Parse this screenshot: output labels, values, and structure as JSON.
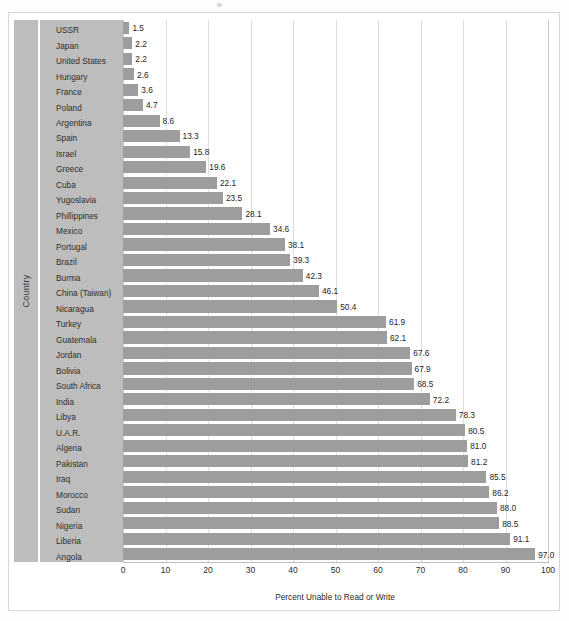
{
  "figure": {
    "y_axis_title": "Country",
    "x_axis_title": "Percent Unable to Read or Write",
    "bar_color": "#9d9d9d",
    "panel_color": "#bdbdbd",
    "plot_background": "#ffffff"
  },
  "chart_data": {
    "type": "bar",
    "orientation": "horizontal",
    "title": "",
    "xlabel": "Percent Unable to Read or Write",
    "ylabel": "Country",
    "xlim": [
      0,
      100
    ],
    "xticks": [
      0,
      10,
      20,
      30,
      40,
      50,
      60,
      70,
      80,
      90,
      100
    ],
    "grid": true,
    "legend": "none",
    "categories": [
      "USSR",
      "Japan",
      "United States",
      "Hungary",
      "France",
      "Poland",
      "Argentina",
      "Spain",
      "Israel",
      "Greece",
      "Cuba",
      "Yugoslavia",
      "Phillippines",
      "Mexico",
      "Portugal",
      "Brazil",
      "Burma",
      "China (Taiwan)",
      "Nicaragua",
      "Turkey",
      "Guatemala",
      "Jordan",
      "Bolivia",
      "South Africa",
      "India",
      "Libya",
      "U.A.R.",
      "Algeria",
      "Pakistan",
      "Iraq",
      "Morocco",
      "Sudan",
      "Nigeria",
      "Liberia",
      "Angola"
    ],
    "values": [
      1.5,
      2.2,
      2.2,
      2.6,
      3.6,
      4.7,
      8.6,
      13.3,
      15.8,
      19.6,
      22.1,
      23.5,
      28.1,
      34.6,
      38.1,
      39.3,
      42.3,
      46.1,
      50.4,
      61.9,
      62.1,
      67.6,
      67.9,
      68.5,
      72.2,
      78.3,
      80.5,
      81.0,
      81.2,
      85.5,
      86.2,
      88.0,
      88.5,
      91.1,
      97.0
    ],
    "value_labels": [
      "1.5",
      "2.2",
      "2.2",
      "2.6",
      "3.6",
      "4.7",
      "8.6",
      "13.3",
      "15.8",
      "19.6",
      "22.1",
      "23.5",
      "28.1",
      "34.6",
      "38.1",
      "39.3",
      "42.3",
      "46.1",
      "50.4",
      "61.9",
      "62.1",
      "67.6",
      "67.9",
      "68.5",
      "72.2",
      "78.3",
      "80.5",
      "81.0",
      "81.2",
      "85.5",
      "86.2",
      "88.0",
      "88.5",
      "91.1",
      "97.0"
    ]
  }
}
